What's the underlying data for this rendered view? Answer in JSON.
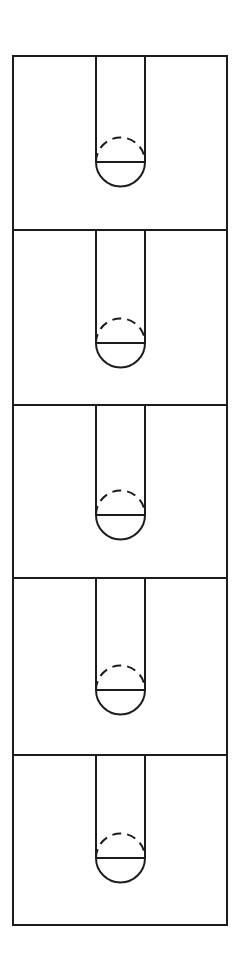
{
  "drawing": {
    "title": "Slot and Hole Detail Views",
    "type": "orthographic-line-drawing",
    "canvas": {
      "width": 240,
      "height": 971,
      "background": "#ffffff"
    },
    "line_color": "#1c1c1c",
    "line_width": 2,
    "hidden_line_dash": "9 6",
    "frame": {
      "x1": 13,
      "y1": 56,
      "x2": 227,
      "y2": 925
    },
    "panel_dividers_y": [
      230,
      405,
      578,
      755
    ],
    "slot": {
      "left_x": 96,
      "right_x": 145,
      "width": 49,
      "radius": 24.5
    },
    "panels": [
      {
        "name": "panel-1",
        "index": 1,
        "top": 56,
        "bottom": 230,
        "slot_top": 56,
        "circle_cx": 120.5,
        "circle_cy": 162,
        "circle_r": 24.5,
        "slot_depth": 106
      },
      {
        "name": "panel-2",
        "index": 2,
        "top": 230,
        "bottom": 405,
        "slot_top": 230,
        "circle_cx": 120.5,
        "circle_cy": 343,
        "circle_r": 24.5,
        "slot_depth": 113
      },
      {
        "name": "panel-3",
        "index": 3,
        "top": 405,
        "bottom": 578,
        "slot_top": 405,
        "circle_cx": 120.5,
        "circle_cy": 515,
        "circle_r": 24.5,
        "slot_depth": 110
      },
      {
        "name": "panel-4",
        "index": 4,
        "top": 578,
        "bottom": 755,
        "slot_top": 578,
        "circle_cx": 120.5,
        "circle_cy": 690,
        "circle_r": 24.5,
        "slot_depth": 112
      },
      {
        "name": "panel-5",
        "index": 5,
        "top": 755,
        "bottom": 925,
        "slot_top": 755,
        "circle_cx": 120.5,
        "circle_cy": 858,
        "circle_r": 24.5,
        "slot_depth": 103
      }
    ]
  }
}
